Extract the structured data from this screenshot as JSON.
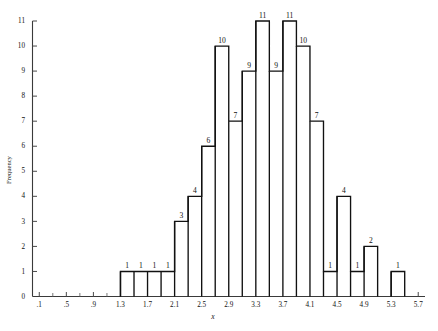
{
  "chart_data": {
    "type": "bar",
    "title": "",
    "subtitle": "",
    "xlabel": "x",
    "ylabel": "Frequency",
    "xlim": [
      0.0,
      5.8
    ],
    "ylim": [
      0,
      11
    ],
    "bin_width": 0.2,
    "grid": false,
    "legend": null,
    "x_tick_labels": [
      ".1",
      ".5",
      ".9",
      "1.3",
      "1.7",
      "2.1",
      "2.5",
      "2.9",
      "3.3",
      "3.7",
      "4.1",
      "4.5",
      "4.9",
      "5.3",
      "5.7"
    ],
    "x_tick_values": [
      0.1,
      0.5,
      0.9,
      1.3,
      1.7,
      2.1,
      2.5,
      2.9,
      3.3,
      3.7,
      4.1,
      4.5,
      4.9,
      5.3,
      5.7
    ],
    "x_minor_tick_values": [
      0.3,
      0.7,
      1.1,
      1.5,
      1.9,
      2.3,
      2.7,
      3.1,
      3.5,
      3.9,
      4.3,
      4.7,
      5.1,
      5.5
    ],
    "y_tick_labels": [
      "0",
      "1",
      "2",
      "3",
      "4",
      "5",
      "6",
      "7",
      "8",
      "9",
      "10",
      "11"
    ],
    "y_tick_values": [
      0,
      1,
      2,
      3,
      4,
      5,
      6,
      7,
      8,
      9,
      10,
      11
    ],
    "bins": [
      {
        "left": 1.3,
        "right": 1.5,
        "value": 1,
        "label": "1"
      },
      {
        "left": 1.5,
        "right": 1.7,
        "value": 1,
        "label": "1"
      },
      {
        "left": 1.7,
        "right": 1.9,
        "value": 1,
        "label": "1"
      },
      {
        "left": 1.9,
        "right": 2.1,
        "value": 1,
        "label": "1"
      },
      {
        "left": 2.1,
        "right": 2.3,
        "value": 3,
        "label": "3"
      },
      {
        "left": 2.3,
        "right": 2.5,
        "value": 4,
        "label": "4"
      },
      {
        "left": 2.5,
        "right": 2.7,
        "value": 6,
        "label": "6"
      },
      {
        "left": 2.7,
        "right": 2.9,
        "value": 10,
        "label": "10"
      },
      {
        "left": 2.9,
        "right": 3.1,
        "value": 7,
        "label": "7"
      },
      {
        "left": 3.1,
        "right": 3.3,
        "value": 9,
        "label": "9"
      },
      {
        "left": 3.3,
        "right": 3.5,
        "value": 11,
        "label": "11"
      },
      {
        "left": 3.5,
        "right": 3.7,
        "value": 9,
        "label": "9"
      },
      {
        "left": 3.7,
        "right": 3.9,
        "value": 11,
        "label": "11"
      },
      {
        "left": 3.9,
        "right": 4.1,
        "value": 10,
        "label": "10"
      },
      {
        "left": 4.1,
        "right": 4.3,
        "value": 7,
        "label": "7"
      },
      {
        "left": 4.3,
        "right": 4.5,
        "value": 1,
        "label": "1"
      },
      {
        "left": 4.5,
        "right": 4.7,
        "value": 4,
        "label": "4"
      },
      {
        "left": 4.7,
        "right": 4.9,
        "value": 1,
        "label": "1"
      },
      {
        "left": 4.9,
        "right": 5.1,
        "value": 2,
        "label": "2"
      },
      {
        "left": 5.1,
        "right": 5.3,
        "value": 0,
        "label": ""
      },
      {
        "left": 5.3,
        "right": 5.5,
        "value": 1,
        "label": "1"
      }
    ],
    "categories": [
      "1.3-1.5",
      "1.5-1.7",
      "1.7-1.9",
      "1.9-2.1",
      "2.1-2.3",
      "2.3-2.5",
      "2.5-2.7",
      "2.7-2.9",
      "2.9-3.1",
      "3.1-3.3",
      "3.3-3.5",
      "3.5-3.7",
      "3.7-3.9",
      "3.9-4.1",
      "4.1-4.3",
      "4.3-4.5",
      "4.5-4.7",
      "4.7-4.9",
      "4.9-5.1",
      "5.1-5.3",
      "5.3-5.5"
    ],
    "values": [
      1,
      1,
      1,
      1,
      3,
      4,
      6,
      10,
      7,
      9,
      11,
      9,
      11,
      10,
      7,
      1,
      4,
      1,
      2,
      0,
      1
    ],
    "total_count": 91,
    "colors": {
      "bar_stroke": "#111111",
      "bar_fill": "none",
      "axis": "#3a3a3a",
      "text": "#111111",
      "background": "#ffffff"
    }
  }
}
